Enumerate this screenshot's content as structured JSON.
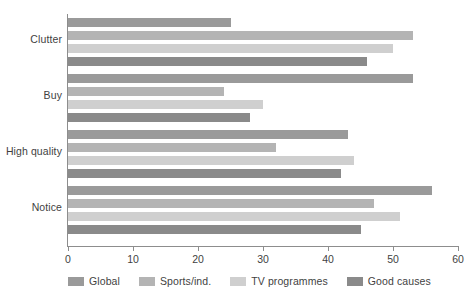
{
  "chart_data": {
    "type": "bar",
    "orientation": "horizontal",
    "title": "",
    "xlabel": "",
    "ylabel": "",
    "xlim": [
      0,
      60
    ],
    "xticks": [
      0,
      10,
      20,
      30,
      40,
      50,
      60
    ],
    "xtick_labels": [
      "0",
      "10",
      "20",
      "30",
      "40",
      "50",
      "60"
    ],
    "grid": false,
    "legend_position": "bottom",
    "categories": [
      "Clutter",
      "Buy",
      "High quality",
      "Notice"
    ],
    "series": [
      {
        "name": "Global",
        "color": "#9a9a9a",
        "values": [
          25,
          53,
          43,
          56
        ]
      },
      {
        "name": "Sports/ind.",
        "color": "#b4b4b4",
        "values": [
          53,
          24,
          32,
          47
        ]
      },
      {
        "name": "TV programmes",
        "color": "#cfcfcf",
        "values": [
          50,
          30,
          44,
          51
        ]
      },
      {
        "name": "Good causes",
        "color": "#8a8a8a",
        "values": [
          46,
          28,
          42,
          45
        ]
      }
    ]
  },
  "legend": {
    "items": [
      {
        "label": "Global",
        "color": "#9a9a9a"
      },
      {
        "label": "Sports/ind.",
        "color": "#b4b4b4"
      },
      {
        "label": "TV programmes",
        "color": "#cfcfcf"
      },
      {
        "label": "Good causes",
        "color": "#8a8a8a"
      }
    ]
  },
  "axis": {
    "value_axis_color": "#8d8d8d",
    "category_axis_color": "#8d8d8d"
  }
}
